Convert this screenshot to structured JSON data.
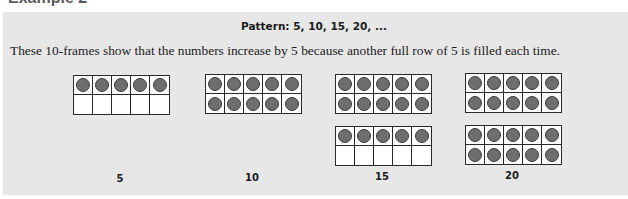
{
  "heading": "Example 2",
  "title": "Pattern: 5, 10, 15, 20, ...",
  "description": "These 10-frames show that the numbers increase by 5 because another full row of 5 is filled each time.",
  "counter_color": "#6e6e6e",
  "panel_color": "#e7e7e7",
  "groups": [
    {
      "label": "5",
      "frames": [
        {
          "filled": 5
        }
      ]
    },
    {
      "label": "10",
      "frames": [
        {
          "filled": 10
        }
      ]
    },
    {
      "label": "15",
      "frames": [
        {
          "filled": 10
        },
        {
          "filled": 5
        }
      ]
    },
    {
      "label": "20",
      "frames": [
        {
          "filled": 10
        },
        {
          "filled": 10
        }
      ]
    }
  ]
}
